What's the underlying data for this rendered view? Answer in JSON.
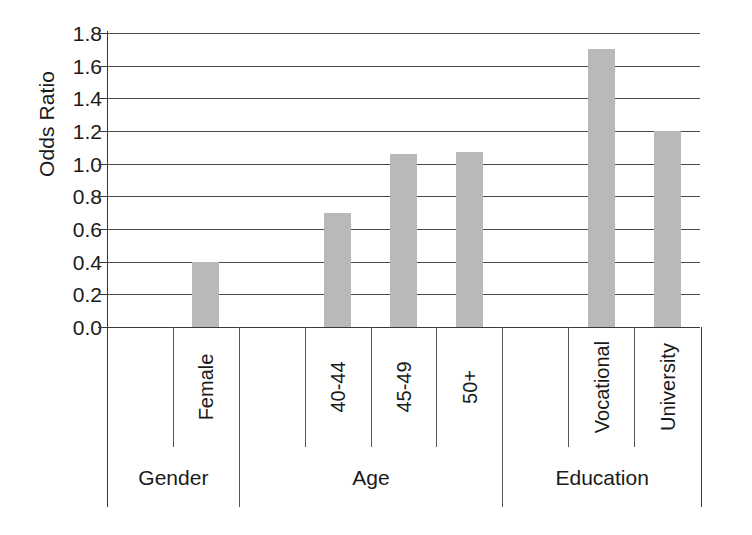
{
  "chart_data": {
    "type": "bar",
    "title": "",
    "xlabel": "",
    "ylabel": "Odds Ratio",
    "ylim": [
      0.0,
      1.8
    ],
    "ytick_labels": [
      "1.8",
      "1.6",
      "1.4",
      "1.2",
      "1.0",
      "0.8",
      "0.6",
      "0.4",
      "0.2",
      "0.0"
    ],
    "ytick_values": [
      1.8,
      1.6,
      1.4,
      1.2,
      1.0,
      0.8,
      0.6,
      0.4,
      0.2,
      0.0
    ],
    "grid": "horizontal",
    "legend": "none",
    "categories": [
      "",
      "Female",
      "",
      "40-44",
      "45-49",
      "50+",
      "",
      "Vocational",
      "University"
    ],
    "values": [
      null,
      0.4,
      null,
      0.7,
      1.06,
      1.07,
      null,
      1.7,
      1.2
    ],
    "bars": [
      {
        "label": "",
        "group": "Gender",
        "value": null,
        "reference": true
      },
      {
        "label": "Female",
        "group": "Gender",
        "value": 0.4,
        "reference": false
      },
      {
        "label": "",
        "group": "Age",
        "value": null,
        "reference": true
      },
      {
        "label": "40-44",
        "group": "Age",
        "value": 0.7,
        "reference": false
      },
      {
        "label": "45-49",
        "group": "Age",
        "value": 1.06,
        "reference": false
      },
      {
        "label": "50+",
        "group": "Age",
        "value": 1.07,
        "reference": false
      },
      {
        "label": "",
        "group": "Education",
        "value": null,
        "reference": true
      },
      {
        "label": "Vocational",
        "group": "Education",
        "value": 1.7,
        "reference": false
      },
      {
        "label": "University",
        "group": "Education",
        "value": 1.2,
        "reference": false
      }
    ],
    "groups": [
      {
        "label": "Gender",
        "span": 2
      },
      {
        "label": "Age",
        "span": 4
      },
      {
        "label": "Education",
        "span": 3
      }
    ],
    "bar_color": "#b9b9b9",
    "axis_color": "#3a3a3a",
    "gridline_color": "#4a4a4a",
    "background": "#ffffff"
  }
}
